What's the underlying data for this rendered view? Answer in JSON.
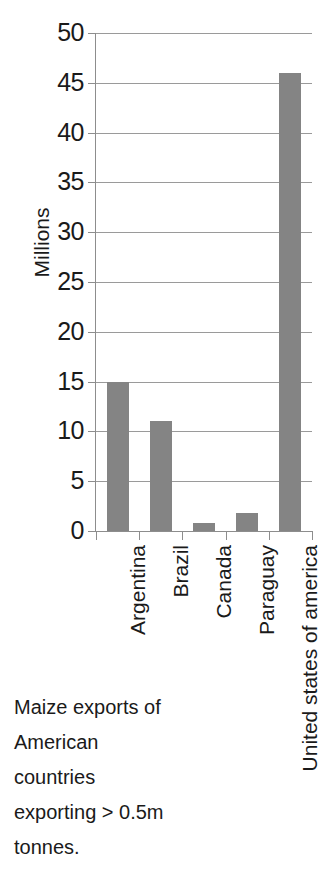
{
  "chart_data": {
    "type": "bar",
    "title": "",
    "categories": [
      "Argentina",
      "Brazil",
      "Canada",
      "Paraguay",
      "United states of america"
    ],
    "values": [
      15,
      11,
      0.8,
      1.8,
      46
    ],
    "series": [
      {
        "name": "Maize exports",
        "values": [
          15,
          11,
          0.8,
          1.8,
          46
        ]
      }
    ],
    "xlabel": "",
    "ylabel": "Millions",
    "ylim": [
      0,
      50
    ],
    "ytick_labels": [
      "50",
      "45",
      "40",
      "35",
      "30",
      "25",
      "20",
      "15",
      "10",
      "5",
      "0"
    ],
    "ytick_values": [
      50,
      45,
      40,
      35,
      30,
      25,
      20,
      15,
      10,
      5,
      0
    ],
    "grid": "horizontal",
    "legend": "none",
    "bar_color": "#848484",
    "gridline_color": "#9a9a9a",
    "axis_color": "#8d8d8d",
    "units": "millions of tonnes"
  },
  "caption": {
    "lines": [
      "Maize exports of",
      "American",
      "countries",
      "exporting > 0.5m",
      "tonnes."
    ],
    "full_text": "Maize exports of American countries exporting > 0.5m tonnes."
  }
}
